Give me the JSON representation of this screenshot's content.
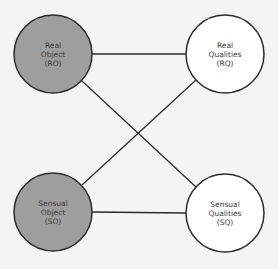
{
  "diagram": {
    "type": "quadruple-object",
    "colors": {
      "background": "#f4f4f2",
      "filled_node": "#9e9e9e",
      "empty_node": "#ffffff",
      "stroke": "#2b2b2b",
      "text": "#3a3a3a"
    },
    "nodes": [
      {
        "id": "RO",
        "lines": [
          "Real",
          "Object",
          "(RO)"
        ],
        "filled": true,
        "cx": 53,
        "cy": 54,
        "r": 39
      },
      {
        "id": "RQ",
        "lines": [
          "Real",
          "Qualities",
          "(RQ)"
        ],
        "filled": false,
        "cx": 225,
        "cy": 54,
        "r": 39
      },
      {
        "id": "SO",
        "lines": [
          "Sensual",
          "Object",
          "(SO)"
        ],
        "filled": true,
        "cx": 53,
        "cy": 212,
        "r": 39
      },
      {
        "id": "SQ",
        "lines": [
          "Sensual",
          "Qualities",
          "(SQ)"
        ],
        "filled": false,
        "cx": 225,
        "cy": 213,
        "r": 39
      }
    ],
    "edges": [
      {
        "from": "RO",
        "to": "RQ"
      },
      {
        "from": "RO",
        "to": "SQ"
      },
      {
        "from": "SO",
        "to": "RQ"
      },
      {
        "from": "SO",
        "to": "SQ"
      }
    ]
  }
}
